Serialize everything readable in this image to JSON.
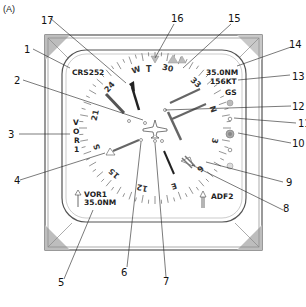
{
  "figure_label": "(A)",
  "display": {
    "course": "CRS252",
    "dme_distance": "35.0NM",
    "ground_speed": "156KT",
    "gs_label": "GS",
    "nav_source_vertical": [
      "V",
      "O",
      "R",
      "1"
    ],
    "bearing1_source": "VOR1",
    "bearing1_distance": "35.0NM",
    "bearing2_source": "ADF2",
    "true_indicator": "T"
  },
  "compass_rose": {
    "labels": [
      {
        "text": "W",
        "angle": -18
      },
      {
        "text": "30",
        "angle": 12
      },
      {
        "text": "33",
        "angle": 42
      },
      {
        "text": "N",
        "angle": 72
      },
      {
        "text": "3",
        "angle": 102
      },
      {
        "text": "6",
        "angle": 132
      },
      {
        "text": "E",
        "angle": 162
      },
      {
        "text": "12",
        "angle": 192
      },
      {
        "text": "15",
        "angle": 222
      },
      {
        "text": "S",
        "angle": 252
      },
      {
        "text": "21",
        "angle": 282
      },
      {
        "text": "24",
        "angle": 312
      }
    ]
  },
  "callouts": [
    {
      "id": "1",
      "text": "1"
    },
    {
      "id": "2",
      "text": "2"
    },
    {
      "id": "3",
      "text": "3"
    },
    {
      "id": "4",
      "text": "4"
    },
    {
      "id": "5",
      "text": "5"
    },
    {
      "id": "6",
      "text": "6"
    },
    {
      "id": "7",
      "text": "7"
    },
    {
      "id": "8",
      "text": "8"
    },
    {
      "id": "9",
      "text": "9"
    },
    {
      "id": "10",
      "text": "10"
    },
    {
      "id": "11",
      "text": "11"
    },
    {
      "id": "12",
      "text": "12"
    },
    {
      "id": "13",
      "text": "13"
    },
    {
      "id": "14",
      "text": "14"
    },
    {
      "id": "15",
      "text": "15"
    },
    {
      "id": "16",
      "text": "16"
    },
    {
      "id": "17",
      "text": "17"
    }
  ]
}
